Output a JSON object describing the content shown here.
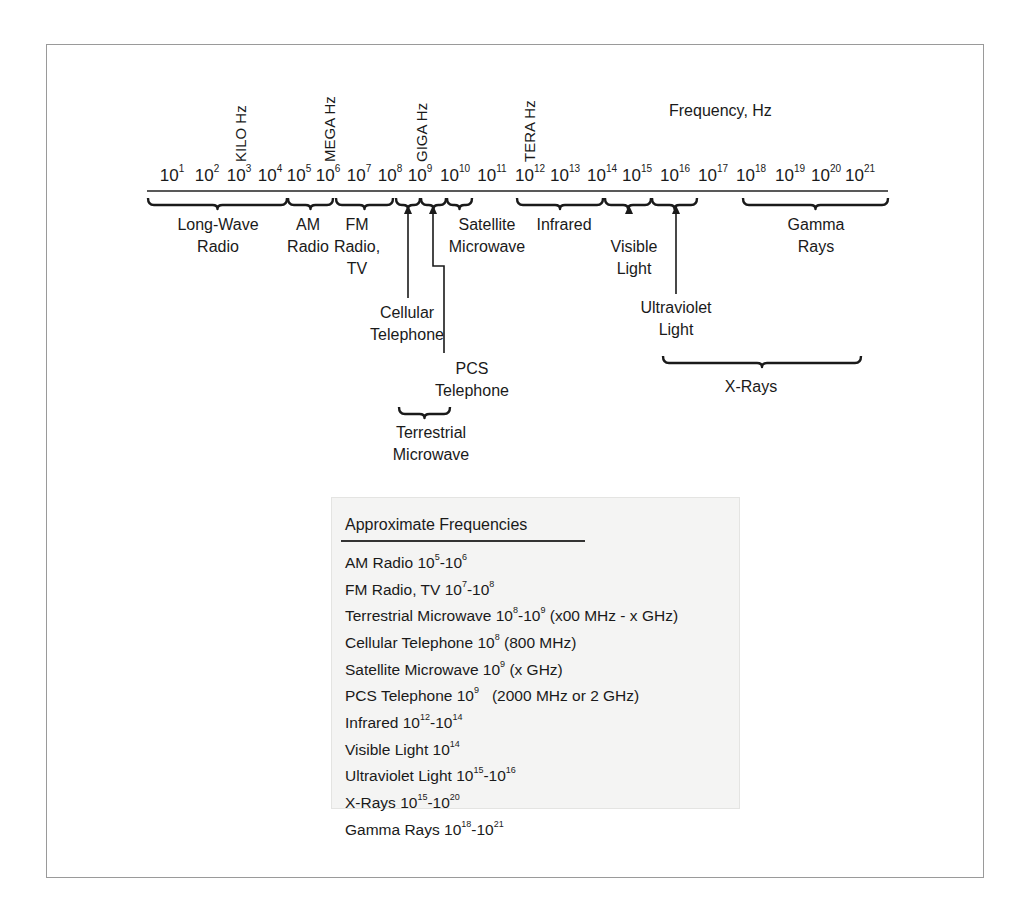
{
  "title": "Frequency, Hz",
  "prefixes": [
    {
      "label": "KILO Hz",
      "x": 233
    },
    {
      "label": "MEGA Hz",
      "x": 322
    },
    {
      "label": "GIGA Hz",
      "x": 414
    },
    {
      "label": "TERA Hz",
      "x": 522
    }
  ],
  "ticks": [
    {
      "base": "10",
      "exp": "1",
      "x": 172
    },
    {
      "base": "10",
      "exp": "2",
      "x": 207
    },
    {
      "base": "10",
      "exp": "3",
      "x": 239
    },
    {
      "base": "10",
      "exp": "4",
      "x": 270
    },
    {
      "base": "10",
      "exp": "5",
      "x": 299
    },
    {
      "base": "10",
      "exp": "6",
      "x": 328
    },
    {
      "base": "10",
      "exp": "7",
      "x": 359
    },
    {
      "base": "10",
      "exp": "8",
      "x": 390
    },
    {
      "base": "10",
      "exp": "9",
      "x": 420
    },
    {
      "base": "10",
      "exp": "10",
      "x": 455
    },
    {
      "base": "10",
      "exp": "11",
      "x": 492
    },
    {
      "base": "10",
      "exp": "12",
      "x": 530
    },
    {
      "base": "10",
      "exp": "13",
      "x": 565
    },
    {
      "base": "10",
      "exp": "14",
      "x": 602
    },
    {
      "base": "10",
      "exp": "15",
      "x": 637
    },
    {
      "base": "10",
      "exp": "16",
      "x": 675
    },
    {
      "base": "10",
      "exp": "17",
      "x": 713
    },
    {
      "base": "10",
      "exp": "18",
      "x": 751
    },
    {
      "base": "10",
      "exp": "19",
      "x": 790
    },
    {
      "base": "10",
      "exp": "20",
      "x": 826
    },
    {
      "base": "10",
      "exp": "21",
      "x": 860
    }
  ],
  "bands": [
    {
      "label_lines": [
        "Long-Wave",
        "Radio"
      ],
      "x": 218,
      "y": 214
    },
    {
      "label_lines": [
        "AM",
        "Radio"
      ],
      "x": 308,
      "y": 214
    },
    {
      "label_lines": [
        "FM",
        "Radio,",
        "TV"
      ],
      "x": 357,
      "y": 214
    },
    {
      "label_lines": [
        "Satellite",
        "Microwave"
      ],
      "x": 487,
      "y": 214
    },
    {
      "label_lines": [
        "Infrared"
      ],
      "x": 564,
      "y": 214
    },
    {
      "label_lines": [
        "Visible",
        "Light"
      ],
      "x": 634,
      "y": 236
    },
    {
      "label_lines": [
        "Ultraviolet",
        "Light"
      ],
      "x": 676,
      "y": 297
    },
    {
      "label_lines": [
        "Cellular",
        "Telephone"
      ],
      "x": 407,
      "y": 302
    },
    {
      "label_lines": [
        "PCS",
        "Telephone"
      ],
      "x": 472,
      "y": 358
    },
    {
      "label_lines": [
        "Terrestrial",
        "Microwave"
      ],
      "x": 431,
      "y": 422
    },
    {
      "label_lines": [
        "Gamma",
        "Rays"
      ],
      "x": 816,
      "y": 214
    },
    {
      "label_lines": [
        "X-Rays"
      ],
      "x": 751,
      "y": 376
    }
  ],
  "legend": {
    "title": "Approximate Frequencies",
    "items": [
      {
        "name": "AM Radio",
        "range": [
          {
            "b": "10",
            "e": "5"
          },
          {
            "b": "10",
            "e": "6"
          }
        ],
        "note": ""
      },
      {
        "name": "FM Radio, TV",
        "range": [
          {
            "b": "10",
            "e": "7"
          },
          {
            "b": "10",
            "e": "8"
          }
        ],
        "note": ""
      },
      {
        "name": "Terrestrial Microwave",
        "range": [
          {
            "b": "10",
            "e": "8"
          },
          {
            "b": "10",
            "e": "9"
          }
        ],
        "note": "(x00 MHz - x GHz)"
      },
      {
        "name": "Cellular Telephone",
        "range": [
          {
            "b": "10",
            "e": "8"
          }
        ],
        "note": "(800 MHz)"
      },
      {
        "name": "Satellite Microwave",
        "range": [
          {
            "b": "10",
            "e": "9"
          }
        ],
        "note": "(x GHz)"
      },
      {
        "name": "PCS Telephone",
        "range": [
          {
            "b": "10",
            "e": "9"
          }
        ],
        "note": "  (2000 MHz or 2 GHz)"
      },
      {
        "name": "Infrared",
        "range": [
          {
            "b": "10",
            "e": "12"
          },
          {
            "b": "10",
            "e": "14"
          }
        ],
        "note": ""
      },
      {
        "name": "Visible Light",
        "range": [
          {
            "b": "10",
            "e": "14"
          }
        ],
        "note": ""
      },
      {
        "name": "Ultraviolet Light",
        "range": [
          {
            "b": "10",
            "e": "15"
          },
          {
            "b": "10",
            "e": "16"
          }
        ],
        "note": ""
      },
      {
        "name": "X-Rays",
        "range": [
          {
            "b": "10",
            "e": "15"
          },
          {
            "b": "10",
            "e": "20"
          }
        ],
        "note": ""
      },
      {
        "name": "Gamma Rays",
        "range": [
          {
            "b": "10",
            "e": "18"
          },
          {
            "b": "10",
            "e": "21"
          }
        ],
        "note": ""
      }
    ]
  },
  "colors": {
    "ink": "#1a1a1a",
    "frame": "#9a9a9a",
    "legend_bg": "#f4f4f3"
  }
}
